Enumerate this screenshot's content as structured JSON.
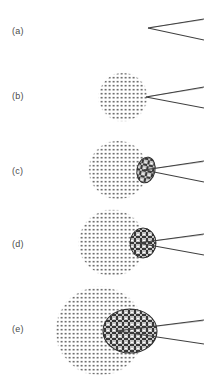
{
  "figure": {
    "title": "",
    "type": "schematic-sequence",
    "background_color": "#ffffff",
    "ink_color": "#3f3f3f",
    "stipple_color": "#6b6b6b",
    "hatch_color": "#2e2e2e",
    "width": 204,
    "height": 385,
    "panels": [
      {
        "id": "a",
        "label": "(a)",
        "label_x": 12,
        "label_y": 26,
        "stipple_circle": null,
        "hatch_blob": null,
        "rays": {
          "count": 2,
          "apex_x": 148,
          "apex_y": 28,
          "tip_upper_x": 204,
          "tip_upper_y": 19,
          "tip_lower_x": 204,
          "tip_lower_y": 40
        }
      },
      {
        "id": "b",
        "label": "(b)",
        "label_x": 12,
        "label_y": 91,
        "stipple_circle": {
          "cx": 123,
          "cy": 97,
          "r": 25
        },
        "hatch_blob": null,
        "rays": {
          "count": 2,
          "apex_x": 146,
          "apex_y": 97,
          "tip_upper_x": 204,
          "tip_upper_y": 87,
          "tip_lower_x": 204,
          "tip_lower_y": 108
        }
      },
      {
        "id": "c",
        "label": "(c)",
        "label_x": 12,
        "label_y": 166,
        "stipple_circle": {
          "cx": 118,
          "cy": 170,
          "r": 30
        },
        "hatch_blob": {
          "cx": 146,
          "cy": 170,
          "rx": 9,
          "ry": 13,
          "rotate": 12
        },
        "rays": {
          "count": 2,
          "apex_x": 144,
          "apex_y": 170,
          "tip_upper_x": 204,
          "tip_upper_y": 161,
          "tip_lower_x": 204,
          "tip_lower_y": 182
        }
      },
      {
        "id": "d",
        "label": "(d)",
        "label_x": 12,
        "label_y": 239,
        "stipple_circle": {
          "cx": 112,
          "cy": 243,
          "r": 34
        },
        "hatch_blob": {
          "cx": 143,
          "cy": 243,
          "rx": 13,
          "ry": 15,
          "rotate": 0
        },
        "rays": {
          "count": 2,
          "apex_x": 138,
          "apex_y": 243,
          "tip_upper_x": 204,
          "tip_upper_y": 234,
          "tip_lower_x": 204,
          "tip_lower_y": 255
        }
      },
      {
        "id": "e",
        "label": "(e)",
        "label_x": 12,
        "label_y": 324,
        "stipple_circle": {
          "cx": 100,
          "cy": 331,
          "r": 45
        },
        "hatch_blob": {
          "cx": 130,
          "cy": 331,
          "rx": 27,
          "ry": 22,
          "rotate": 0
        },
        "rays": {
          "count": 2,
          "apex_x": 117,
          "apex_y": 331,
          "tip_upper_x": 204,
          "tip_upper_y": 320,
          "tip_lower_x": 204,
          "tip_lower_y": 344
        }
      }
    ]
  }
}
